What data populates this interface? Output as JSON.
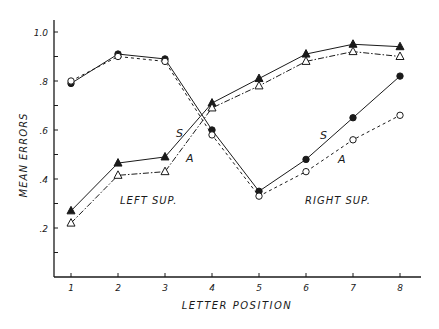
{
  "chart_data": {
    "type": "line",
    "title": "",
    "xlabel": "LETTER POSITION",
    "ylabel": "MEAN ERRORS",
    "x": [
      1,
      2,
      3,
      4,
      5,
      6,
      7,
      8
    ],
    "x_tick_labels": [
      "1",
      "2",
      "3",
      "4",
      "5",
      "6",
      "7",
      "8"
    ],
    "y_tick_labels": [
      ".2",
      ".4",
      ".6",
      ".8",
      "1.0"
    ],
    "y_ticks": [
      0.2,
      0.4,
      0.6,
      0.8,
      1.0
    ],
    "ylim": [
      0,
      1.05
    ],
    "grid": false,
    "legend": "none (inline labels)",
    "series": [
      {
        "name": "Left sup. S",
        "group": "LEFT SUP.",
        "label": "S",
        "marker": "filled-triangle",
        "line": "solid",
        "values": [
          0.27,
          0.465,
          0.49,
          0.71,
          0.81,
          0.91,
          0.95,
          0.94
        ]
      },
      {
        "name": "Left sup. A",
        "group": "LEFT SUP.",
        "label": "A",
        "marker": "open-triangle",
        "line": "dash-dot",
        "values": [
          0.22,
          0.415,
          0.43,
          0.69,
          0.78,
          0.88,
          0.92,
          0.9
        ]
      },
      {
        "name": "Right sup. S",
        "group": "RIGHT SUP.",
        "label": "S",
        "marker": "filled-circle",
        "line": "solid",
        "values": [
          0.79,
          0.91,
          0.89,
          0.6,
          0.35,
          0.48,
          0.65,
          0.82
        ]
      },
      {
        "name": "Right sup. A",
        "group": "RIGHT SUP.",
        "label": "A",
        "marker": "open-circle",
        "line": "dashed",
        "values": [
          0.8,
          0.9,
          0.88,
          0.58,
          0.33,
          0.43,
          0.56,
          0.66
        ]
      }
    ],
    "annotations": [
      {
        "text": "LEFT SUP.",
        "x": 120,
        "y": 204
      },
      {
        "text": "RIGHT SUP.",
        "x": 305,
        "y": 204
      },
      {
        "text": "S",
        "x": 176,
        "y": 137
      },
      {
        "text": "A",
        "x": 186,
        "y": 162
      },
      {
        "text": "S",
        "x": 320,
        "y": 139
      },
      {
        "text": "A",
        "x": 338,
        "y": 163
      }
    ]
  },
  "colors": {
    "ink": "#1a1a1a",
    "background": "#ffffff"
  }
}
